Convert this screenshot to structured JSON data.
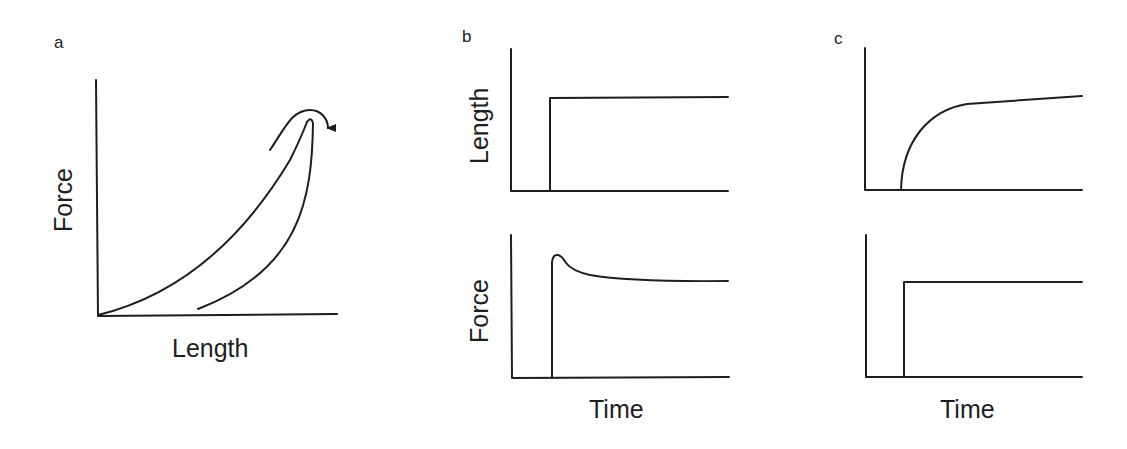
{
  "figure": {
    "panels": [
      {
        "id": "a",
        "letter": "a",
        "xlabel": "Length",
        "ylabel": "Force",
        "description": "Force-length loading/unloading hysteresis loop with curved arrow indicating direction at peak"
      },
      {
        "id": "b",
        "letter": "b",
        "xlabel": "Time",
        "top": {
          "ylabel": "Length",
          "description": "Step increase in length"
        },
        "bottom": {
          "ylabel": "Force",
          "description": "Force spikes then relaxes to plateau (stress relaxation)"
        }
      },
      {
        "id": "c",
        "letter": "c",
        "xlabel": "Time",
        "top": {
          "ylabel": "",
          "description": "Length rises gradually then creeps slowly (creep)"
        },
        "bottom": {
          "ylabel": "",
          "description": "Step increase in force"
        }
      }
    ],
    "colors": {
      "line": "#1e1e1e",
      "background": "#ffffff"
    }
  }
}
